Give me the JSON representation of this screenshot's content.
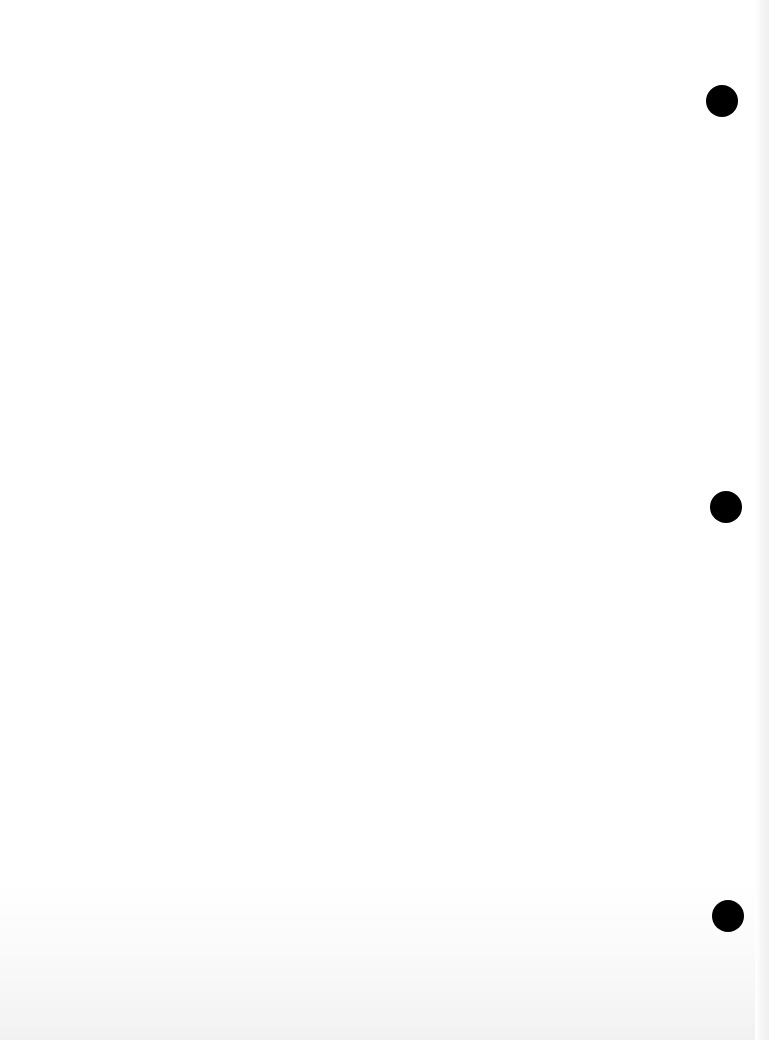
{
  "document": {
    "type": "blank scanned page",
    "text": "",
    "punch_holes": [
      {
        "position": "top",
        "color": "#000000"
      },
      {
        "position": "middle",
        "color": "#000000"
      },
      {
        "position": "bottom",
        "color": "#000000"
      }
    ],
    "background_color": "#ffffff"
  }
}
